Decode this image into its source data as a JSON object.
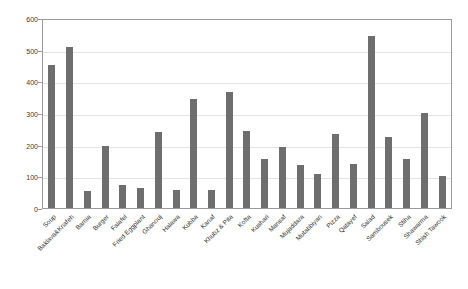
{
  "chart_data": {
    "type": "bar",
    "title": "",
    "xlabel": "",
    "ylabel": "",
    "ylim": [
      0,
      600
    ],
    "yticks": [
      0,
      100,
      200,
      300,
      400,
      500,
      600
    ],
    "grid": true,
    "legend": null,
    "bar_color": "#6e6e6e",
    "categories": [
      "Soup",
      "Baklava&Knafeh",
      "Bamia",
      "Burger",
      "Falafel",
      "Fried Eggplant",
      "Ghanouj",
      "Halawa",
      "Kubba",
      "Kanaf",
      "Khubz & Pita",
      "Kofta",
      "Kushari",
      "Mansaf",
      "Mujaddara",
      "Mutabbiyan",
      "Pizza",
      "Qatayef",
      "Salad",
      "Sambousek",
      "Sfiha",
      "Shawarma",
      "Shish Tawook"
    ],
    "values": [
      455,
      515,
      55,
      197,
      75,
      64,
      243,
      57,
      347,
      57,
      370,
      245,
      155,
      194,
      136,
      109,
      237,
      141,
      548,
      227,
      156,
      302,
      103
    ]
  }
}
